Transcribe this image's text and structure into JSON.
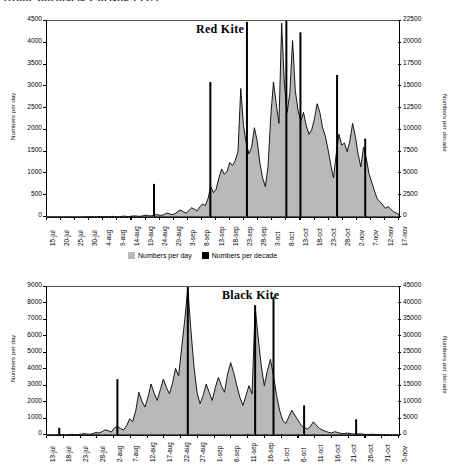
{
  "caption_fragment": "(from Shirihai & Christie 1992)",
  "legend": {
    "day_label": "Numbers per day",
    "decade_label": "Numbers per decade",
    "day_color": "#b9b9b9",
    "decade_color": "#000000"
  },
  "chart_data": [
    {
      "id": "red-kite",
      "type": "area",
      "title": "Red Kite",
      "xlabel": "",
      "ylabel": "Numbers per day",
      "y2label": "Numbers per decade",
      "ylim": [
        0,
        4500
      ],
      "y2lim": [
        0,
        22500
      ],
      "yticks": [
        0,
        500,
        1000,
        1500,
        2000,
        2500,
        3000,
        3500,
        4000,
        4500
      ],
      "y2ticks": [
        0,
        2500,
        5000,
        7500,
        10000,
        12500,
        15000,
        17500,
        20000,
        22500
      ],
      "grid": false,
      "legend_position": "below",
      "xtick_labels": [
        "15-jul",
        "20-jul",
        "25-jul",
        "30-jul",
        "4-aug",
        "9-aug",
        "14-aug",
        "19-aug",
        "24-aug",
        "29-aug",
        "3-sep",
        "8-sep",
        "13-sep",
        "18-sep",
        "23-sep",
        "28-sep",
        "3-oct",
        "8-oct",
        "13-oct",
        "18-oct",
        "23-oct",
        "28-oct",
        "2-nov",
        "7-nov",
        "12-nov",
        "17-nov"
      ],
      "x_start": "15-jul",
      "x_end": "17-nov",
      "n_days": 126,
      "series": [
        {
          "name": "Numbers per day",
          "axis": "left",
          "style": "filled-area",
          "color": "#b9b9b9",
          "values": [
            0,
            0,
            0,
            0,
            0,
            0,
            0,
            0,
            0,
            0,
            0,
            0,
            0,
            0,
            5,
            5,
            10,
            5,
            5,
            10,
            10,
            5,
            5,
            10,
            15,
            10,
            5,
            10,
            20,
            15,
            10,
            20,
            25,
            20,
            15,
            25,
            40,
            30,
            25,
            35,
            55,
            45,
            35,
            60,
            90,
            70,
            55,
            80,
            130,
            160,
            120,
            90,
            150,
            210,
            180,
            140,
            230,
            300,
            260,
            420,
            700,
            560,
            640,
            900,
            1100,
            980,
            1050,
            1250,
            1180,
            1300,
            1500,
            2950,
            2100,
            1700,
            1450,
            1600,
            2050,
            1750,
            1250,
            900,
            700,
            1150,
            2300,
            3100,
            2600,
            2150,
            4450,
            3050,
            2400,
            2850,
            4050,
            2900,
            2450,
            2200,
            2400,
            2100,
            1900,
            2000,
            2250,
            2600,
            2400,
            2050,
            1850,
            1550,
            1200,
            900,
            1450,
            1900,
            1650,
            1700,
            1500,
            1750,
            2150,
            1850,
            1450,
            1150,
            1600,
            1350,
            1000,
            800,
            600,
            420,
            350,
            280,
            200,
            240,
            180,
            120,
            90,
            60
          ]
        },
        {
          "name": "Numbers per decade",
          "axis": "right",
          "style": "vertical-bars",
          "color": "#000000",
          "bars": [
            {
              "day_index": 38,
              "value": 3800
            },
            {
              "day_index": 58,
              "value": 15500
            },
            {
              "day_index": 71,
              "value": 22400
            },
            {
              "day_index": 85,
              "value": 22500
            },
            {
              "day_index": 90,
              "value": 21200
            },
            {
              "day_index": 103,
              "value": 16300
            },
            {
              "day_index": 113,
              "value": 9000
            }
          ]
        }
      ]
    },
    {
      "id": "black-kite",
      "type": "area",
      "title": "Black Kite",
      "xlabel": "",
      "ylabel": "Numbers per day",
      "y2label": "Numbers per decade",
      "ylim": [
        0,
        9000
      ],
      "y2lim": [
        0,
        45000
      ],
      "yticks": [
        0,
        1000,
        2000,
        3000,
        4000,
        5000,
        6000,
        7000,
        8000,
        9000
      ],
      "y2ticks": [
        0,
        5000,
        10000,
        15000,
        20000,
        25000,
        30000,
        35000,
        40000,
        45000
      ],
      "grid": false,
      "legend_position": "none",
      "xtick_labels": [
        "13-jul",
        "18-jul",
        "23-jul",
        "28-jul",
        "2-aug",
        "7-aug",
        "12-aug",
        "17-aug",
        "22-aug",
        "27-aug",
        "1-sep",
        "6-sep",
        "11-sep",
        "16-sep",
        "1-oct",
        "6-oct",
        "11-oct",
        "16-oct",
        "21-oct",
        "26-oct",
        "31-oct",
        "5-nov"
      ],
      "x_start": "13-jul",
      "x_end": "5-nov",
      "n_days": 116,
      "series": [
        {
          "name": "Numbers per day",
          "axis": "left",
          "style": "filled-area",
          "color": "#b9b9b9",
          "values": [
            0,
            0,
            0,
            10,
            20,
            10,
            0,
            20,
            40,
            30,
            20,
            50,
            80,
            60,
            40,
            90,
            150,
            120,
            200,
            320,
            260,
            180,
            420,
            520,
            400,
            300,
            560,
            980,
            820,
            1480,
            2600,
            2050,
            1700,
            2300,
            3100,
            2550,
            2100,
            2750,
            3400,
            2900,
            2500,
            3150,
            4050,
            3600,
            5300,
            7000,
            8950,
            6400,
            4200,
            2600,
            1900,
            2400,
            3100,
            2600,
            2100,
            2900,
            3500,
            3000,
            2600,
            3700,
            4400,
            3800,
            3000,
            2300,
            1800,
            2400,
            3000,
            2500,
            7800,
            5900,
            4200,
            3000,
            3900,
            4600,
            3600,
            2400,
            1500,
            900,
            700,
            1100,
            1500,
            1200,
            900,
            600,
            450,
            350,
            500,
            800,
            600,
            400,
            300,
            220,
            160,
            120,
            200,
            150,
            100,
            80,
            120,
            90,
            60,
            50,
            80,
            60,
            40,
            30,
            50,
            40,
            30,
            20,
            30,
            20,
            15,
            10,
            5,
            5
          ]
        },
        {
          "name": "Numbers per decade",
          "axis": "right",
          "style": "vertical-bars",
          "color": "#000000",
          "bars": [
            {
              "day_index": 4,
              "value": 2200
            },
            {
              "day_index": 23,
              "value": 17000
            },
            {
              "day_index": 46,
              "value": 45000
            },
            {
              "day_index": 68,
              "value": 39500
            },
            {
              "day_index": 74,
              "value": 42000
            },
            {
              "day_index": 84,
              "value": 9000
            },
            {
              "day_index": 101,
              "value": 4800
            }
          ]
        }
      ]
    }
  ]
}
